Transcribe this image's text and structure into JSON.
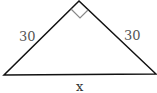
{
  "diagram": {
    "type": "right-isosceles-triangle",
    "labels": {
      "left_leg": "30",
      "right_leg": "30",
      "hypotenuse": "x"
    },
    "right_angle_marker": true,
    "colors": {
      "stroke": "#111111",
      "marker": "#888888",
      "label": "#555555"
    }
  }
}
